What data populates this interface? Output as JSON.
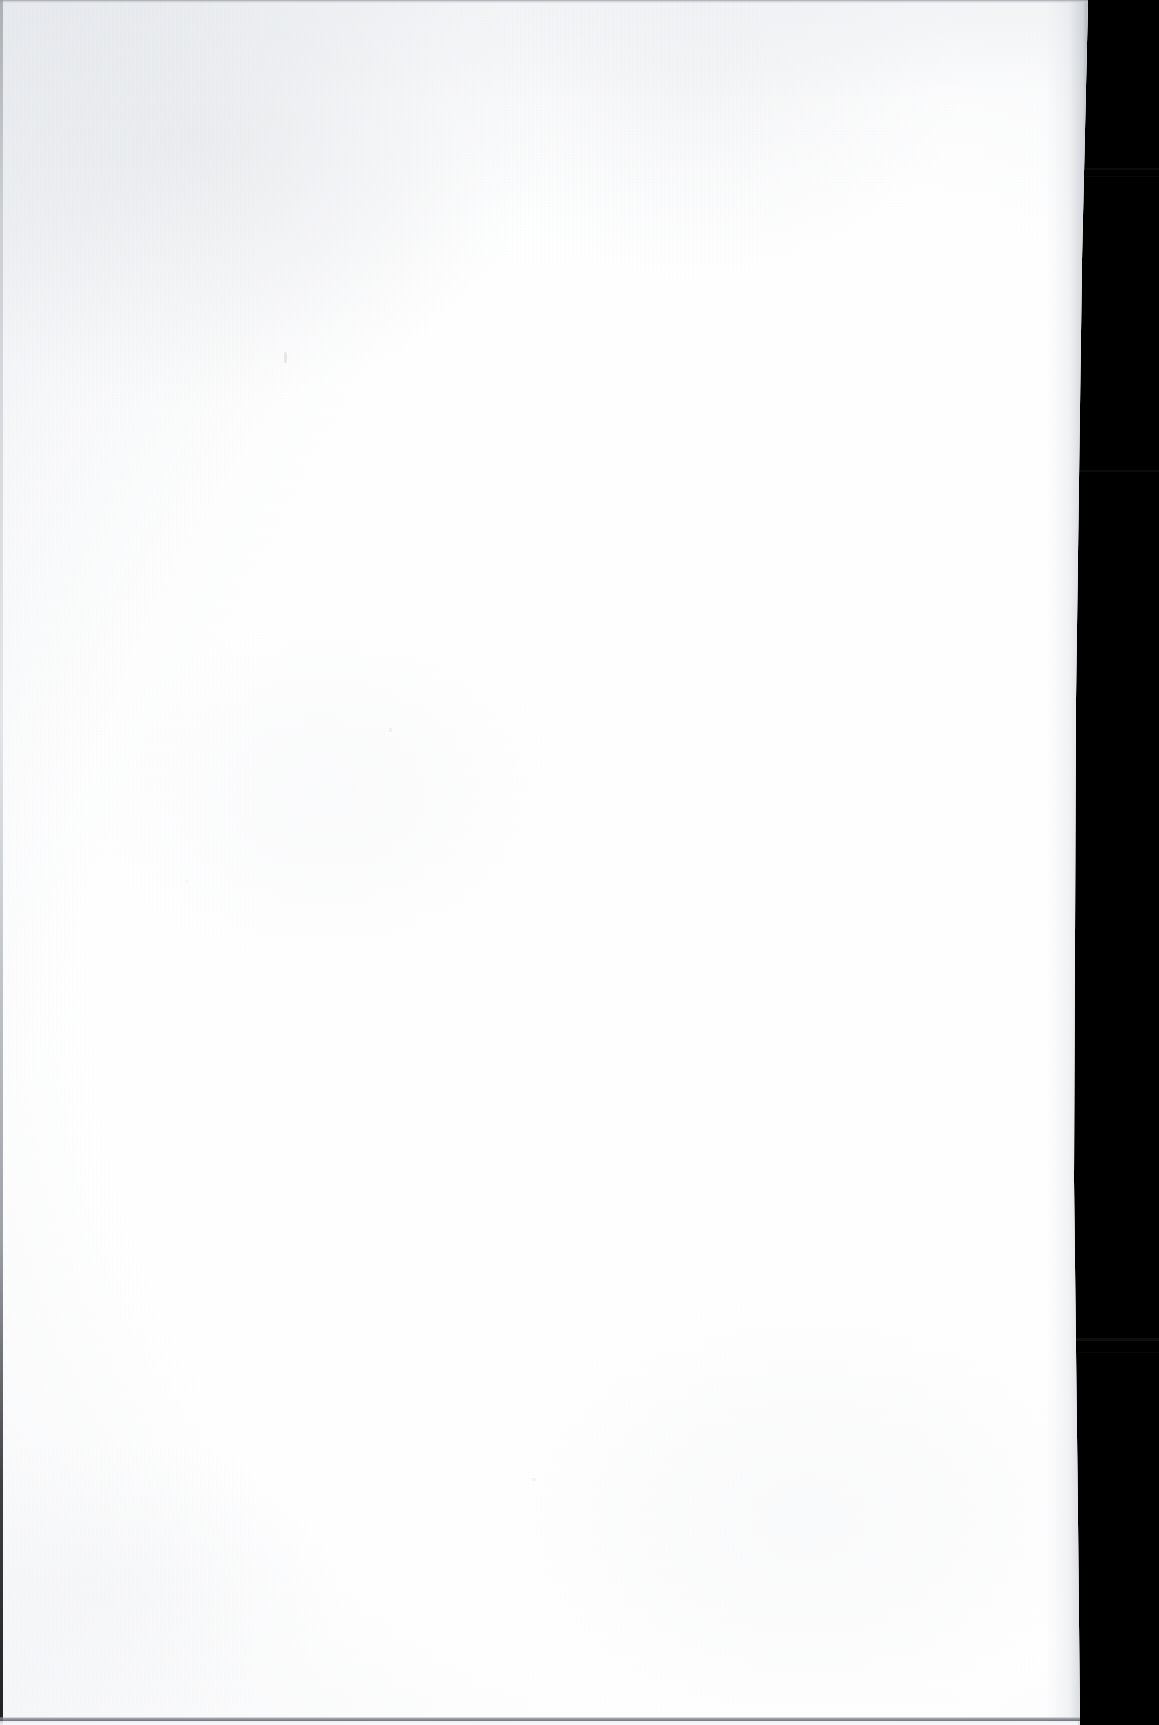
{
  "document": {
    "kind": "scanned-page",
    "page_content": "",
    "page_content_description": "Blank page — no printed or handwritten content",
    "caption": "Blank scanned page",
    "orientation": "portrait",
    "page_width_px": 1159,
    "page_height_px": 1725
  },
  "sheet": {
    "name": "paper-sheet",
    "fill_color": "#ffffff",
    "tone_color": "#f1f3f6",
    "edge_color": "#8c9096",
    "right_edge_x_top": 1088,
    "right_edge_x_waist": 1074,
    "right_edge_x_bottom": 1080
  },
  "background": {
    "name": "scanner-void",
    "color": "#000000",
    "bands": [
      {
        "label": "scan-band-1",
        "top": 168,
        "width": 92
      },
      {
        "label": "scan-band-2",
        "top": 176,
        "width": 168
      },
      {
        "label": "scan-band-3",
        "top": 470,
        "width": 168
      },
      {
        "label": "scan-band-4",
        "top": 1338,
        "width": 168
      },
      {
        "label": "scan-band-5",
        "top": 1352,
        "width": 120
      }
    ]
  },
  "edges": {
    "top_label": "page-top-edge",
    "left_label": "page-left-edge",
    "bottom_label": "page-bottom-edge",
    "right_label": "page-right-edge"
  },
  "artifacts": [
    {
      "label": "dust-speck",
      "x": 284,
      "y": 352
    },
    {
      "label": "dust-speck",
      "x": 389,
      "y": 728
    },
    {
      "label": "dust-speck",
      "x": 186,
      "y": 880
    },
    {
      "label": "dust-speck",
      "x": 532,
      "y": 1478
    }
  ]
}
